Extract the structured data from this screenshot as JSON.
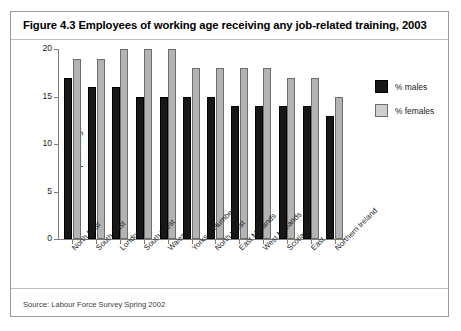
{
  "figure": {
    "title": "Figure 4.3 Employees of working age receiving any job-related training, 2003",
    "source": "Source: Labour Force Survey Spring 2002"
  },
  "legend": {
    "males_label": "% males",
    "females_label": "% females"
  },
  "chart_data": {
    "type": "bar",
    "title": "Figure 4.3 Employees of working age receiving any job-related training, 2003",
    "xlabel": "",
    "ylabel": "percentage",
    "ylim": [
      0,
      20
    ],
    "yticks": [
      0,
      5,
      10,
      15,
      20
    ],
    "ytick_labels": [
      "0",
      "5",
      "10",
      "15",
      "20"
    ],
    "grid": false,
    "legend_position": "right",
    "categories": [
      "North East",
      "South East",
      "London",
      "South West",
      "Wales",
      "Yorks & Humber",
      "North West",
      "East Midlands",
      "West Midlands",
      "Scotland",
      "East",
      "Northern Ireland"
    ],
    "series": [
      {
        "name": "% males",
        "color": "#171717",
        "values": [
          17,
          16,
          16,
          15,
          15,
          15,
          15,
          14,
          14,
          14,
          14,
          13
        ]
      },
      {
        "name": "% females",
        "color": "#b3b3b3",
        "values": [
          19,
          19,
          20,
          20,
          20,
          18,
          18,
          18,
          18,
          17,
          17,
          15
        ]
      }
    ]
  }
}
